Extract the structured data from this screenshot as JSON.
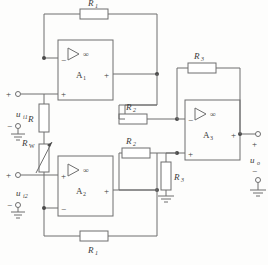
{
  "diagram": {
    "type": "schematic"
  },
  "colors": {
    "wire": "#6e6e6e",
    "node": "#4a4a4a",
    "text": "#3a3a3a",
    "background": "#fdfdfc",
    "resistor_fill": "#ffffff"
  },
  "opamps": [
    {
      "id": "A1",
      "name": "A",
      "index": "1",
      "gain_symbol": "∞",
      "input_top": "−",
      "input_bottom": "+",
      "output_sign": "+"
    },
    {
      "id": "A2",
      "name": "A",
      "index": "2",
      "gain_symbol": "∞",
      "input_top": "+",
      "input_bottom": "−",
      "output_sign": "+"
    },
    {
      "id": "A3",
      "name": "A",
      "index": "3",
      "gain_symbol": "∞",
      "input_top": "−",
      "input_bottom": "+",
      "output_sign": "+"
    }
  ],
  "resistors": [
    {
      "id": "R1_top",
      "label": "R",
      "index": "1",
      "orientation": "horizontal",
      "variable": false
    },
    {
      "id": "R1_bottom",
      "label": "R",
      "index": "1",
      "orientation": "horizontal",
      "variable": false
    },
    {
      "id": "R",
      "label": "R",
      "index": "",
      "orientation": "vertical",
      "variable": false
    },
    {
      "id": "RW",
      "label": "R",
      "index": "W",
      "orientation": "vertical",
      "variable": true
    },
    {
      "id": "R2_top",
      "label": "R",
      "index": "2",
      "orientation": "horizontal",
      "variable": false
    },
    {
      "id": "R2_bottom",
      "label": "R",
      "index": "2",
      "orientation": "horizontal",
      "variable": false
    },
    {
      "id": "R3_feedback",
      "label": "R",
      "index": "3",
      "orientation": "horizontal",
      "variable": false
    },
    {
      "id": "R3_ground",
      "label": "R",
      "index": "3",
      "orientation": "vertical",
      "variable": false
    }
  ],
  "signals": [
    {
      "id": "ui1",
      "label": "u",
      "index": "i1",
      "plus": "+",
      "minus": "−",
      "side": "input"
    },
    {
      "id": "ui2",
      "label": "u",
      "index": "i2",
      "plus": "+",
      "minus": "−",
      "side": "input"
    },
    {
      "id": "uo",
      "label": "u",
      "index": "o",
      "plus": "+",
      "minus": "−",
      "side": "output"
    }
  ],
  "grounds": [
    {
      "id": "gnd-ui1"
    },
    {
      "id": "gnd-ui2"
    },
    {
      "id": "gnd-r3"
    },
    {
      "id": "gnd-uo"
    }
  ]
}
